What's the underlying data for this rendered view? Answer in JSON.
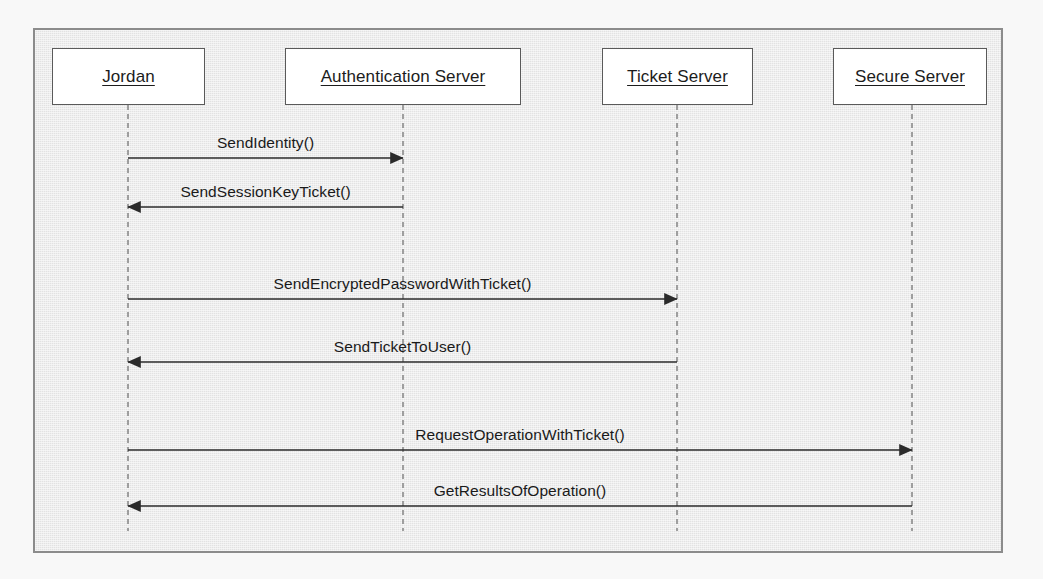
{
  "diagram": {
    "type": "uml-sequence-diagram",
    "title": "",
    "frame": {
      "x": 33,
      "y": 28,
      "width": 970,
      "height": 525
    },
    "colors": {
      "page_background": "#f8f8f8",
      "frame_background": "#e9e9e9",
      "frame_border": "#8c8c8c",
      "box_fill": "#ffffff",
      "box_border": "#5a5a5a",
      "lifeline": "#8a8a8a",
      "arrow": "#2b2b2b",
      "text": "#1a1a1a"
    },
    "participants": [
      {
        "id": "jordan",
        "label": "Jordan",
        "box": {
          "x": 52,
          "y": 48,
          "width": 153,
          "height": 57
        },
        "lifeline_x": 128,
        "lifeline_top": 105,
        "lifeline_bottom": 531
      },
      {
        "id": "auth",
        "label": "Authentication Server",
        "box": {
          "x": 285,
          "y": 48,
          "width": 236,
          "height": 57
        },
        "lifeline_x": 403,
        "lifeline_top": 105,
        "lifeline_bottom": 531
      },
      {
        "id": "ticket",
        "label": "Ticket Server",
        "box": {
          "x": 602,
          "y": 48,
          "width": 151,
          "height": 57
        },
        "lifeline_x": 677,
        "lifeline_top": 105,
        "lifeline_bottom": 531
      },
      {
        "id": "secure",
        "label": "Secure Server",
        "box": {
          "x": 833,
          "y": 48,
          "width": 154,
          "height": 57
        },
        "lifeline_x": 912,
        "lifeline_top": 105,
        "lifeline_bottom": 531
      }
    ],
    "messages": [
      {
        "seq": 1,
        "label": "SendIdentity()",
        "from": "jordan",
        "to": "auth",
        "direction": "right",
        "y": 158,
        "x1": 128,
        "x2": 403
      },
      {
        "seq": 2,
        "label": "SendSessionKeyTicket()",
        "from": "auth",
        "to": "jordan",
        "direction": "left",
        "y": 207,
        "x1": 403,
        "x2": 128
      },
      {
        "seq": 3,
        "label": "SendEncryptedPasswordWithTicket()",
        "from": "jordan",
        "to": "ticket",
        "direction": "right",
        "y": 299,
        "x1": 128,
        "x2": 677
      },
      {
        "seq": 4,
        "label": "SendTicketToUser()",
        "from": "ticket",
        "to": "jordan",
        "direction": "left",
        "y": 362,
        "x1": 677,
        "x2": 128
      },
      {
        "seq": 5,
        "label": "RequestOperationWithTicket()",
        "from": "jordan",
        "to": "secure",
        "direction": "right",
        "y": 450,
        "x1": 128,
        "x2": 912
      },
      {
        "seq": 6,
        "label": "GetResultsOfOperation()",
        "from": "secure",
        "to": "jordan",
        "direction": "left",
        "y": 506,
        "x1": 912,
        "x2": 128
      }
    ]
  }
}
